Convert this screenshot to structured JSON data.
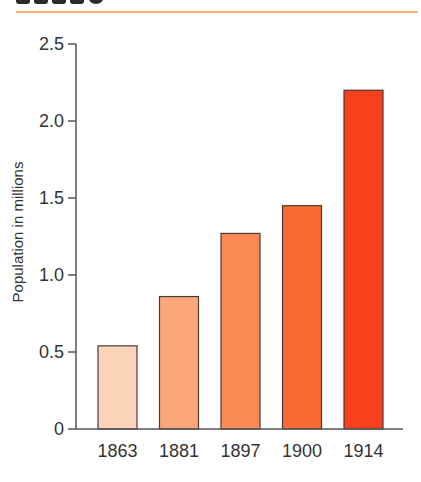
{
  "header": {
    "rule_color": "#f7b07a"
  },
  "chart_data": {
    "type": "bar",
    "title": "",
    "xlabel": "",
    "ylabel": "Population in millions",
    "categories": [
      "1863",
      "1881",
      "1897",
      "1900",
      "1914"
    ],
    "values": [
      0.54,
      0.86,
      1.27,
      1.45,
      2.2
    ],
    "colors": [
      "#fbd3b8",
      "#fca779",
      "#fc8a55",
      "#fb6a33",
      "#f9401c"
    ],
    "ylim": [
      0,
      2.5
    ],
    "yticks": [
      0,
      0.5,
      1.0,
      1.5,
      2.0,
      2.5
    ],
    "ytick_labels": [
      "0",
      "0.5",
      "1.0",
      "1.5",
      "2.0",
      "2.5"
    ],
    "grid": false,
    "legend": null
  }
}
